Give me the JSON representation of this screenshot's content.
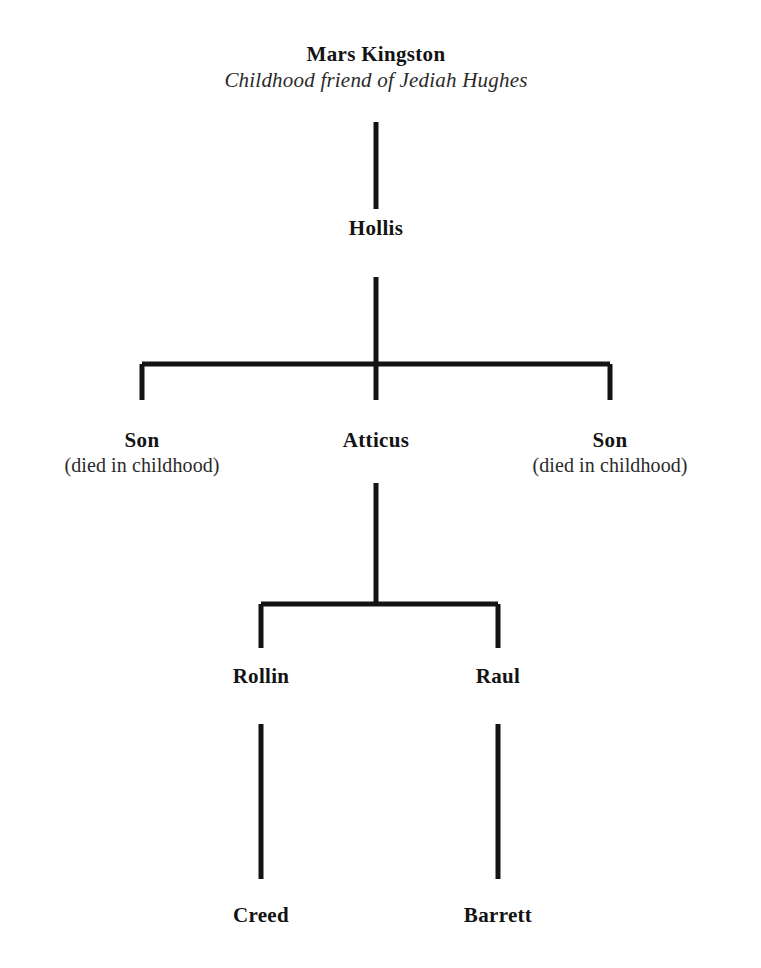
{
  "diagram": {
    "kind": "family-tree",
    "title_node": "Mars Kingston",
    "background_color": "#ffffff",
    "line_color": "#131313",
    "text_color": "#131313",
    "line_width": 5,
    "canvas": {
      "width": 761,
      "height": 968
    }
  },
  "nodes": [
    {
      "id": "mars-kingston",
      "name": "Mars Kingston",
      "note": "Childhood friend of Jediah Hughes",
      "note_style": "italic",
      "generation": 0,
      "x": 376,
      "y": 42
    },
    {
      "id": "hollis",
      "name": "Hollis",
      "note": "",
      "note_style": "none",
      "generation": 1,
      "x": 376,
      "y": 216
    },
    {
      "id": "son-left",
      "name": "Son",
      "note": "(died in childhood)",
      "note_style": "plain",
      "generation": 2,
      "x": 142,
      "y": 428
    },
    {
      "id": "atticus",
      "name": "Atticus",
      "note": "",
      "note_style": "none",
      "generation": 2,
      "x": 376,
      "y": 428
    },
    {
      "id": "son-right",
      "name": "Son",
      "note": "(died in childhood)",
      "note_style": "plain",
      "generation": 2,
      "x": 610,
      "y": 428
    },
    {
      "id": "rollin",
      "name": "Rollin",
      "note": "",
      "note_style": "none",
      "generation": 3,
      "x": 261,
      "y": 664
    },
    {
      "id": "raul",
      "name": "Raul",
      "note": "",
      "note_style": "none",
      "generation": 3,
      "x": 498,
      "y": 664
    },
    {
      "id": "creed",
      "name": "Creed",
      "note": "",
      "note_style": "none",
      "generation": 4,
      "x": 261,
      "y": 903
    },
    {
      "id": "barrett",
      "name": "Barrett",
      "note": "",
      "note_style": "none",
      "generation": 4,
      "x": 498,
      "y": 903
    }
  ],
  "connectors": [
    {
      "id": "mars-to-hollis",
      "type": "stem",
      "from": "mars-kingston",
      "to": "hollis",
      "x": 376,
      "y1": 122,
      "y2": 209
    },
    {
      "id": "hollis-to-children-bus",
      "type": "bracket",
      "from": "hollis",
      "to": [
        "son-left",
        "atticus",
        "son-right"
      ],
      "stem_x": 376,
      "stem_y1": 277,
      "bus_y": 364,
      "bus_x1": 142,
      "bus_x2": 610,
      "drop_y": 400,
      "drops": [
        142,
        376,
        610
      ]
    },
    {
      "id": "atticus-to-children-bracket",
      "type": "bracket",
      "from": "atticus",
      "to": [
        "rollin",
        "raul"
      ],
      "stem_x": 376,
      "stem_y1": 483,
      "bus_y": 604,
      "bus_x1": 261,
      "bus_x2": 498,
      "drop_y": 648,
      "drops": [
        261,
        498
      ]
    },
    {
      "id": "rollin-to-creed",
      "type": "stem",
      "from": "rollin",
      "to": "creed",
      "x": 261,
      "y1": 724,
      "y2": 879
    },
    {
      "id": "raul-to-barrett",
      "type": "stem",
      "from": "raul",
      "to": "barrett",
      "x": 498,
      "y1": 724,
      "y2": 879
    }
  ]
}
